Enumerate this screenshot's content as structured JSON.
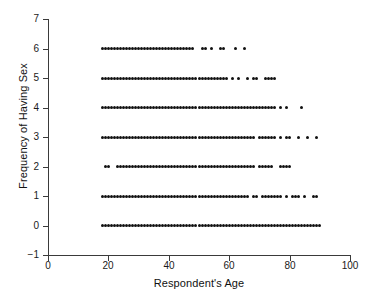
{
  "chart_data": {
    "type": "scatter",
    "title": "",
    "xlabel": "Respondent's Age",
    "ylabel": "Frequency of Having Sex",
    "xlim": [
      0,
      100
    ],
    "ylim": [
      -1,
      7
    ],
    "xticks": [
      0,
      20,
      40,
      60,
      80,
      100
    ],
    "yticks": [
      -1,
      0,
      1,
      2,
      3,
      4,
      5,
      6,
      7
    ],
    "grid": false,
    "legend": null,
    "marker": {
      "shape": "circle",
      "color": "#111111",
      "size_px": 3
    },
    "note": "Each y-level is a discrete frequency category; points are one-per-respondent-age, producing dense horizontal bands.",
    "series": [
      {
        "name": "Frequency 6",
        "y": 6,
        "x": [
          18,
          19,
          20,
          21,
          22,
          23,
          24,
          25,
          26,
          27,
          28,
          29,
          30,
          31,
          32,
          33,
          34,
          35,
          36,
          37,
          38,
          39,
          40,
          41,
          42,
          43,
          44,
          45,
          46,
          47,
          48,
          51,
          52,
          54,
          57,
          58,
          62,
          65
        ]
      },
      {
        "name": "Frequency 5",
        "y": 5,
        "x": [
          18,
          19,
          20,
          21,
          22,
          23,
          24,
          25,
          26,
          27,
          28,
          29,
          30,
          31,
          32,
          33,
          34,
          35,
          36,
          37,
          38,
          39,
          40,
          41,
          42,
          43,
          44,
          45,
          46,
          47,
          48,
          49,
          50,
          51,
          52,
          53,
          54,
          55,
          56,
          57,
          58,
          59,
          61,
          63,
          66,
          68,
          69,
          72,
          73,
          74,
          75
        ]
      },
      {
        "name": "Frequency 4",
        "y": 4,
        "x": [
          18,
          19,
          20,
          21,
          22,
          23,
          24,
          25,
          26,
          27,
          28,
          29,
          30,
          31,
          32,
          33,
          34,
          35,
          36,
          37,
          38,
          39,
          40,
          41,
          42,
          43,
          44,
          45,
          46,
          47,
          48,
          49,
          50,
          51,
          52,
          53,
          54,
          55,
          56,
          57,
          58,
          59,
          60,
          61,
          62,
          63,
          64,
          65,
          66,
          67,
          68,
          69,
          70,
          71,
          72,
          73,
          74,
          75,
          77,
          79,
          84
        ]
      },
      {
        "name": "Frequency 3",
        "y": 3,
        "x": [
          18,
          19,
          20,
          21,
          22,
          23,
          24,
          25,
          26,
          27,
          28,
          29,
          30,
          31,
          32,
          33,
          34,
          35,
          36,
          37,
          38,
          39,
          40,
          41,
          42,
          43,
          44,
          45,
          46,
          47,
          48,
          49,
          50,
          51,
          52,
          53,
          54,
          55,
          56,
          57,
          58,
          59,
          60,
          61,
          62,
          63,
          64,
          65,
          66,
          67,
          68,
          70,
          71,
          72,
          73,
          74,
          75,
          77,
          79,
          80,
          83,
          86,
          89
        ]
      },
      {
        "name": "Frequency 2",
        "y": 2,
        "x": [
          19,
          20,
          23,
          24,
          25,
          26,
          27,
          28,
          29,
          30,
          31,
          32,
          33,
          34,
          35,
          36,
          37,
          38,
          39,
          40,
          41,
          42,
          43,
          44,
          45,
          46,
          47,
          48,
          49,
          50,
          51,
          52,
          53,
          54,
          55,
          56,
          57,
          58,
          59,
          60,
          61,
          62,
          63,
          64,
          65,
          66,
          67,
          68,
          70,
          71,
          72,
          73,
          74,
          77,
          78,
          79,
          80
        ]
      },
      {
        "name": "Frequency 1",
        "y": 1,
        "x": [
          18,
          19,
          20,
          21,
          22,
          23,
          24,
          25,
          26,
          27,
          28,
          29,
          30,
          31,
          32,
          33,
          34,
          35,
          36,
          37,
          38,
          39,
          40,
          41,
          42,
          43,
          44,
          45,
          46,
          47,
          48,
          49,
          50,
          51,
          52,
          53,
          54,
          55,
          56,
          57,
          58,
          59,
          60,
          61,
          62,
          63,
          64,
          65,
          66,
          68,
          69,
          71,
          72,
          73,
          74,
          75,
          76,
          77,
          79,
          81,
          82,
          83,
          85,
          88,
          89
        ]
      },
      {
        "name": "Frequency 0",
        "y": 0,
        "x": [
          18,
          19,
          20,
          21,
          22,
          23,
          24,
          25,
          26,
          27,
          28,
          29,
          30,
          31,
          32,
          33,
          34,
          35,
          36,
          37,
          38,
          39,
          40,
          41,
          42,
          43,
          44,
          45,
          46,
          47,
          48,
          49,
          50,
          51,
          52,
          53,
          54,
          55,
          56,
          57,
          58,
          59,
          60,
          61,
          62,
          63,
          64,
          65,
          66,
          67,
          68,
          69,
          70,
          71,
          72,
          73,
          74,
          75,
          76,
          77,
          78,
          79,
          80,
          81,
          82,
          83,
          84,
          85,
          86,
          87,
          88,
          89,
          90
        ]
      }
    ]
  }
}
